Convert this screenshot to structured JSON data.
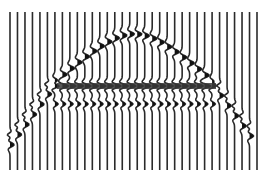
{
  "figure": {
    "kind": "seismic-wiggle-section",
    "background": "#ffffff",
    "trace_color": "#2a2a2a",
    "fill_color": "#111111",
    "trace_count": 34,
    "x_start": 10,
    "x_end": 257,
    "y_top": 12,
    "y_bottom": 170,
    "reflector_y": 86,
    "reflector_x_start": 57,
    "reflector_x_end": 216,
    "hyperbola_apex_y": 34,
    "hyperbola_center_x": 133,
    "diffraction_left_x": 56,
    "diffraction_right_x": 215,
    "diffraction_tail_bottom_y": 145
  }
}
